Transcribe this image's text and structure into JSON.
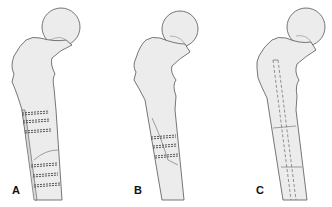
{
  "figure": {
    "panels": [
      {
        "label": "A",
        "description": "Proximal femur with plate and multiple cerclage wires across fracture"
      },
      {
        "label": "B",
        "description": "Proximal femur with three cerclage wires around oblique fracture"
      },
      {
        "label": "C",
        "description": "Proximal femur with intramedullary nail across fractures"
      }
    ]
  },
  "colors": {
    "bone_fill": "#ececec",
    "outline": "#555555",
    "wire": "#444444",
    "nail": "#777777",
    "background": "#ffffff"
  }
}
